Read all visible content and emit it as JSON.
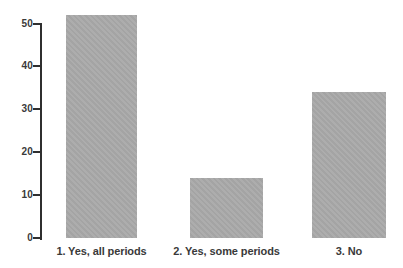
{
  "chart_data": {
    "type": "bar",
    "title": "",
    "xlabel": "",
    "ylabel": "",
    "categories": [
      "1. Yes, all periods",
      "2. Yes, some periods",
      "3. No"
    ],
    "values": [
      52,
      14,
      34
    ],
    "yticks": [
      0,
      10,
      20,
      30,
      40,
      50
    ],
    "ylim": [
      0,
      52
    ],
    "grid": false,
    "legend_position": "none",
    "colors": {
      "bar_fill": "#a9a9a9",
      "axis": "#2f2f2f",
      "tick_label": "#3a3a3a",
      "category_label": "#3a3a3a",
      "background": "#ffffff"
    }
  }
}
